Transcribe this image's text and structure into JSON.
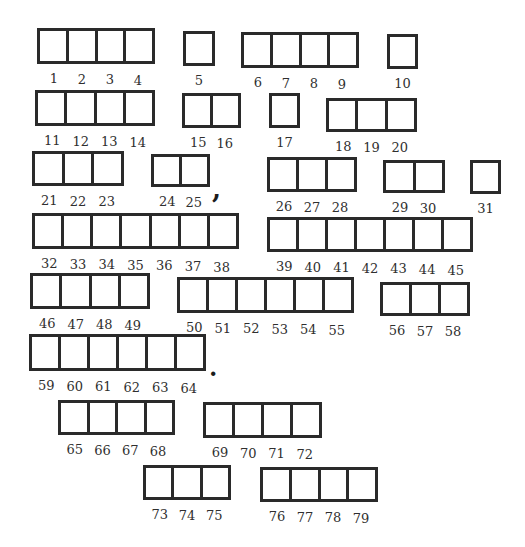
{
  "puzzle": {
    "colors": {
      "border": "#2a2a2a",
      "number": "#2f2f2f",
      "background": "#ffffff"
    },
    "words": [
      {
        "x": 37,
        "y": 28,
        "w": 118,
        "h": 36,
        "cells": [
          1,
          2,
          3,
          4
        ]
      },
      {
        "x": 183,
        "y": 31,
        "w": 32,
        "h": 35,
        "cells": [
          5
        ]
      },
      {
        "x": 241,
        "y": 32,
        "w": 118,
        "h": 36,
        "cells": [
          6,
          7,
          8,
          9
        ]
      },
      {
        "x": 387,
        "y": 34,
        "w": 31,
        "h": 35,
        "cells": [
          10
        ]
      },
      {
        "x": 35,
        "y": 90,
        "w": 120,
        "h": 36,
        "cells": [
          11,
          12,
          13,
          14
        ]
      },
      {
        "x": 182,
        "y": 93,
        "w": 59,
        "h": 35,
        "cells": [
          15,
          16
        ]
      },
      {
        "x": 269,
        "y": 93,
        "w": 31,
        "h": 35,
        "cells": [
          17
        ]
      },
      {
        "x": 326,
        "y": 98,
        "w": 91,
        "h": 34,
        "cells": [
          18,
          19,
          20
        ]
      },
      {
        "x": 32,
        "y": 151,
        "w": 92,
        "h": 35,
        "cells": [
          21,
          22,
          23
        ]
      },
      {
        "x": 151,
        "y": 154,
        "w": 59,
        "h": 33,
        "cells": [
          24,
          25
        ]
      },
      {
        "x": 267,
        "y": 157,
        "w": 90,
        "h": 35,
        "cells": [
          26,
          27,
          28
        ]
      },
      {
        "x": 383,
        "y": 160,
        "w": 62,
        "h": 33,
        "cells": [
          29,
          30
        ]
      },
      {
        "x": 470,
        "y": 160,
        "w": 31,
        "h": 34,
        "cells": [
          31
        ]
      },
      {
        "x": 32,
        "y": 213,
        "w": 207,
        "h": 36,
        "cells": [
          32,
          33,
          34,
          35,
          36,
          37,
          38
        ]
      },
      {
        "x": 267,
        "y": 217,
        "w": 206,
        "h": 35,
        "cells": [
          39,
          40,
          41,
          42,
          43,
          44,
          45
        ]
      },
      {
        "x": 30,
        "y": 273,
        "w": 120,
        "h": 36,
        "cells": [
          46,
          47,
          48,
          49
        ]
      },
      {
        "x": 177,
        "y": 277,
        "w": 177,
        "h": 36,
        "cells": [
          50,
          51,
          52,
          53,
          54,
          55
        ]
      },
      {
        "x": 380,
        "y": 282,
        "w": 90,
        "h": 34,
        "cells": [
          56,
          57,
          58
        ]
      },
      {
        "x": 29,
        "y": 334,
        "w": 177,
        "h": 37,
        "cells": [
          59,
          60,
          61,
          62,
          63,
          64
        ]
      },
      {
        "x": 58,
        "y": 400,
        "w": 117,
        "h": 35,
        "cells": [
          65,
          66,
          67,
          68
        ]
      },
      {
        "x": 203,
        "y": 402,
        "w": 119,
        "h": 36,
        "cells": [
          69,
          70,
          71,
          72
        ]
      },
      {
        "x": 143,
        "y": 465,
        "w": 88,
        "h": 35,
        "cells": [
          73,
          74,
          75
        ]
      },
      {
        "x": 260,
        "y": 467,
        "w": 118,
        "h": 35,
        "cells": [
          76,
          77,
          78,
          79
        ]
      }
    ],
    "punctuation": [
      {
        "char": ",",
        "x": 212,
        "y": 176,
        "size": 26,
        "name": "comma-mark"
      },
      {
        "char": ".",
        "x": 209,
        "y": 356,
        "size": 24,
        "name": "period-mark"
      }
    ]
  }
}
